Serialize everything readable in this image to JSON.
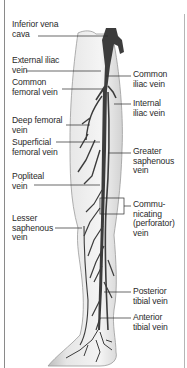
{
  "diagram": {
    "colors": {
      "vein": "#3c3c3c",
      "leg_fill": "#ececec",
      "leg_shade": "#c8c8c8",
      "leader_line": "#2a2a2a",
      "text": "#2a2a2a"
    },
    "labels_left": [
      {
        "id": "inferior-vena-cava",
        "text": "Inferior vena\ncava"
      },
      {
        "id": "external-iliac-vein",
        "text": "External iliac\nvein"
      },
      {
        "id": "common-femoral-vein",
        "text": "Common\nfemoral vein"
      },
      {
        "id": "deep-femoral-vein",
        "text": "Deep femoral\nvein"
      },
      {
        "id": "superficial-femoral-vein",
        "text": "Superficial\nfemoral vein"
      },
      {
        "id": "popliteal-vein",
        "text": "Popliteal\nvein"
      },
      {
        "id": "lesser-saphenous-vein",
        "text": "Lesser\nsaphenous\nvein"
      }
    ],
    "labels_right": [
      {
        "id": "common-iliac-vein",
        "text": "Common\niliac vein"
      },
      {
        "id": "internal-iliac-vein",
        "text": "Internal\niliac vein"
      },
      {
        "id": "greater-saphenous-vein",
        "text": "Greater\nsaphenous\nvein"
      },
      {
        "id": "communicating-perforator-vein",
        "text": "Commu-\nnicating\n(perforator)\nvein"
      },
      {
        "id": "posterior-tibial-vein",
        "text": "Posterior\ntibial vein"
      },
      {
        "id": "anterior-tibial-vein",
        "text": "Anterior\ntibial vein"
      }
    ]
  }
}
